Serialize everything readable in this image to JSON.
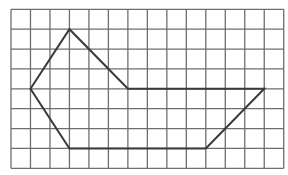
{
  "grid": {
    "columns": 14,
    "rows": 8,
    "origin_x": 11,
    "origin_y": 9.3,
    "cell_width": 19.48,
    "cell_height": 19.88,
    "line_color": "#6e6e6e",
    "line_width": 1.3
  },
  "polygon": {
    "vertices": [
      [
        1,
        4
      ],
      [
        3,
        1
      ],
      [
        6,
        4
      ],
      [
        13,
        4
      ],
      [
        10,
        7
      ],
      [
        3,
        7
      ]
    ],
    "stroke_color": "#3a3a3a",
    "stroke_width": 2
  }
}
